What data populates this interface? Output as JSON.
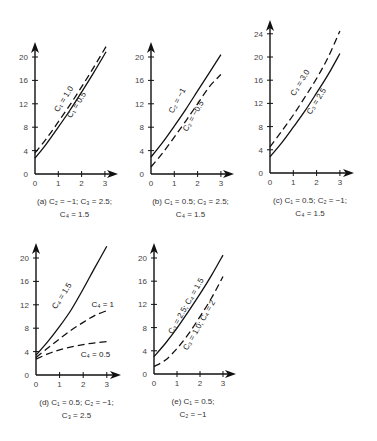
{
  "chart_data": [
    {
      "id": "a",
      "type": "line",
      "caption": [
        "(a) C₂ = −1; C₃ = 2.5;",
        "C₄ = 1.5"
      ],
      "xlim": [
        0,
        3
      ],
      "ylim": [
        0,
        20
      ],
      "xticks": [
        0,
        1,
        2,
        3
      ],
      "yticks": [
        0,
        4,
        8,
        12,
        16,
        20
      ],
      "box": {
        "x0": 35,
        "y0": 174,
        "xs": 23.3,
        "ys": 5.85,
        "ytop": 42,
        "xright": 118
      },
      "series": [
        {
          "name": "C₁ = 1.0",
          "dash": true,
          "x": [
            0,
            0.5,
            1,
            1.5,
            2,
            2.5,
            3.05
          ],
          "y": [
            3.6,
            6.1,
            8.9,
            11.8,
            14.9,
            18.1,
            21.8
          ],
          "label_at": [
            1.0,
            10.5
          ],
          "angle": -58
        },
        {
          "name": "C₁ = 0.5",
          "dash": false,
          "x": [
            0,
            0.5,
            1,
            1.5,
            2,
            2.5,
            3.05
          ],
          "y": [
            2.7,
            5.2,
            8.0,
            10.9,
            14.0,
            17.2,
            20.9
          ],
          "label_at": [
            1.55,
            9.5
          ],
          "angle": -58
        }
      ]
    },
    {
      "id": "b",
      "type": "line",
      "caption": [
        "(b) C₁ = 0.5; C₃ = 2.5;",
        "C₄ = 1.5"
      ],
      "xlim": [
        0,
        3
      ],
      "ylim": [
        0,
        20
      ],
      "xticks": [
        0,
        1,
        2,
        3
      ],
      "yticks": [
        0,
        4,
        8,
        12,
        16,
        20
      ],
      "box": {
        "x0": 151,
        "y0": 174,
        "xs": 23.3,
        "ys": 5.85,
        "ytop": 42,
        "xright": 234
      },
      "series": [
        {
          "name": "C₂ = −1",
          "dash": false,
          "x": [
            0,
            0.5,
            1,
            1.5,
            2,
            2.5,
            3
          ],
          "y": [
            2.9,
            5.4,
            8.2,
            11.1,
            14.2,
            17.3,
            20.4
          ],
          "label_at": [
            0.95,
            10.3
          ],
          "angle": -62
        },
        {
          "name": "C₂ = −0.5",
          "dash": true,
          "x": [
            0,
            0.5,
            1,
            1.5,
            2,
            2.5,
            3
          ],
          "y": [
            1.2,
            3.6,
            6.3,
            9.1,
            12.0,
            14.9,
            17.0
          ],
          "label_at": [
            1.55,
            7.2
          ],
          "angle": -60
        }
      ]
    },
    {
      "id": "c",
      "type": "line",
      "caption": [
        "(c) C₁ = 0.5; C₂ = −1;",
        "C₄ = 1.5"
      ],
      "xlim": [
        0,
        3
      ],
      "ylim": [
        0,
        24
      ],
      "xticks": [
        0,
        1,
        2,
        3
      ],
      "yticks": [
        0,
        4,
        8,
        12,
        16,
        20,
        24
      ],
      "box": {
        "x0": 270,
        "y0": 173,
        "xs": 23.3,
        "ys": 5.8,
        "ytop": 20,
        "xright": 354
      },
      "series": [
        {
          "name": "C₃ = 3.0",
          "dash": true,
          "x": [
            0,
            0.5,
            1,
            1.5,
            2,
            2.5,
            3
          ],
          "y": [
            4.5,
            7.2,
            10.0,
            13.1,
            16.3,
            20.0,
            24.5
          ],
          "label_at": [
            1.05,
            13.2
          ],
          "angle": -58
        },
        {
          "name": "C₃ = 2.5",
          "dash": false,
          "x": [
            0,
            0.5,
            1,
            1.5,
            2,
            2.5,
            3
          ],
          "y": [
            2.8,
            5.2,
            7.9,
            10.7,
            13.8,
            17.0,
            20.6
          ],
          "label_at": [
            1.75,
            10.0
          ],
          "angle": -58
        }
      ]
    },
    {
      "id": "d",
      "type": "line",
      "caption": [
        "(d) C₁ = 0.5; C₂ = −1;",
        "C₃ = 2.5"
      ],
      "xlim": [
        0,
        3
      ],
      "ylim": [
        0,
        20
      ],
      "xticks": [
        0,
        1,
        2,
        3
      ],
      "yticks": [
        0,
        4,
        8,
        12,
        16,
        20
      ],
      "box": {
        "x0": 36,
        "y0": 375,
        "xs": 23.6,
        "ys": 5.85,
        "ytop": 243,
        "xright": 121
      },
      "series": [
        {
          "name": "C₄ = 1.5",
          "dash": false,
          "x": [
            0,
            0.5,
            1,
            1.5,
            2,
            2.5,
            3
          ],
          "y": [
            3.4,
            5.7,
            8.3,
            11.2,
            14.7,
            18.4,
            22.0
          ],
          "label_at": [
            0.85,
            11.2
          ],
          "angle": -57
        },
        {
          "name": "C₄ = 1",
          "dash": true,
          "x": [
            0,
            0.5,
            1,
            1.5,
            2,
            2.5,
            3
          ],
          "y": [
            3.0,
            4.6,
            6.2,
            7.7,
            9.0,
            10.2,
            11.0
          ],
          "label_at": [
            2.35,
            11.7
          ],
          "angle": 0
        },
        {
          "name": "C₄ = 0.5",
          "dash": true,
          "x": [
            0,
            0.5,
            1,
            1.5,
            2,
            2.5,
            3
          ],
          "y": [
            2.7,
            3.6,
            4.3,
            4.8,
            5.2,
            5.5,
            5.7
          ],
          "label_at": [
            1.9,
            3.0
          ],
          "angle": 0
        }
      ]
    },
    {
      "id": "e",
      "type": "line",
      "caption": [
        "(e) C₁ = 0.5;",
        "C₂ = −1"
      ],
      "xlim": [
        0,
        3
      ],
      "ylim": [
        0,
        20
      ],
      "xticks": [
        0,
        1,
        2,
        3
      ],
      "yticks": [
        0,
        4,
        8,
        12,
        16,
        20
      ],
      "box": {
        "x0": 154,
        "y0": 374,
        "xs": 23.0,
        "ys": 5.8,
        "ytop": 243,
        "xright": 236
      },
      "series": [
        {
          "name": "C₃ = 2.5; C₄ = 1.5",
          "dash": false,
          "x": [
            0,
            0.5,
            1,
            1.5,
            2,
            2.5,
            3
          ],
          "y": [
            3.0,
            5.3,
            7.9,
            10.8,
            13.8,
            17.0,
            20.5
          ],
          "label_at": [
            0.8,
            6.8
          ],
          "angle": -60
        },
        {
          "name": "C₃ = 1.0; C₄ = 2",
          "dash": true,
          "x": [
            0,
            0.5,
            1,
            1.5,
            2,
            2.5,
            3
          ],
          "y": [
            1.3,
            2.4,
            4.4,
            6.9,
            9.9,
            13.1,
            16.8
          ],
          "label_at": [
            1.45,
            4.0
          ],
          "angle": -60
        }
      ]
    }
  ]
}
